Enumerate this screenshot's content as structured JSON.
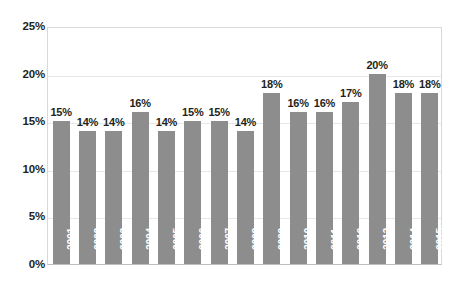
{
  "chart_data": {
    "type": "bar",
    "title": "",
    "subtitle": "",
    "xlabel": "",
    "ylabel": "",
    "categories": [
      "2001",
      "2002",
      "2003",
      "2004",
      "2005",
      "2006",
      "2007",
      "2008",
      "2009",
      "2010",
      "2011",
      "2012",
      "2013",
      "2014",
      "2015"
    ],
    "values": [
      15,
      14,
      14,
      16,
      14,
      15,
      15,
      14,
      18,
      16,
      16,
      17,
      20,
      18,
      18
    ],
    "value_labels": [
      "15%",
      "14%",
      "14%",
      "16%",
      "14%",
      "15%",
      "15%",
      "14%",
      "18%",
      "16%",
      "16%",
      "17%",
      "20%",
      "18%",
      "18%"
    ],
    "ylim": [
      0,
      25
    ],
    "ytick_values": [
      0,
      5,
      10,
      15,
      20,
      25
    ],
    "ytick_labels": [
      "0%",
      "5%",
      "10%",
      "15%",
      "20%",
      "25%"
    ],
    "grid": true,
    "legend": false,
    "legend_position": "none",
    "series": [
      {
        "name": "",
        "values": [
          15,
          14,
          14,
          16,
          14,
          15,
          15,
          14,
          18,
          16,
          16,
          17,
          20,
          18,
          18
        ]
      }
    ]
  },
  "style": {
    "bar_color": "#8d8d8d",
    "gridline_color": "#e8e8e8",
    "axis_color": "#bdbdbd",
    "label_color": "#231f20",
    "year_label_color": "#ffffff",
    "background": "#ffffff"
  }
}
